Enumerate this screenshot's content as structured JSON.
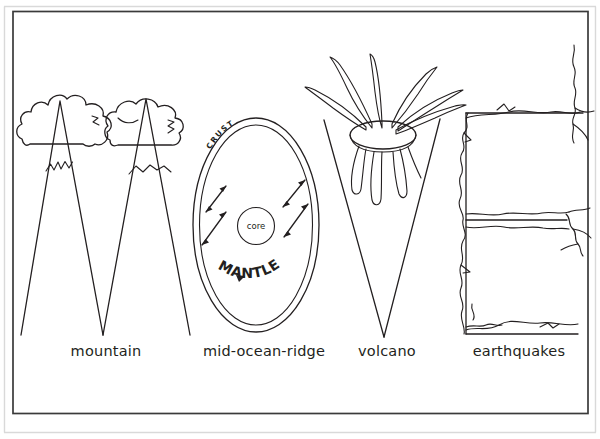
{
  "page": {
    "kind": "coloring-page-line-art",
    "background_color": "#ffffff",
    "ink_color": "#231f20",
    "frame_color": "#3a3a3a",
    "outer_rule_color": "#d9d9d9",
    "word_spelled": "MOVE"
  },
  "letters": [
    {
      "glyph": "M",
      "icon_name": "mountain-illustration",
      "concept": "mountain",
      "details": [
        "two peaks",
        "cloud over each peak",
        "jagged snow line"
      ]
    },
    {
      "glyph": "O",
      "icon_name": "earth-cross-section-illustration",
      "concept": "mid-ocean-ridge",
      "details": [
        "outer ellipse",
        "inner ellipse",
        "core circle",
        "four double-headed arrows"
      ]
    },
    {
      "glyph": "V",
      "icon_name": "volcano-illustration",
      "concept": "volcano",
      "details": [
        "crater ellipse",
        "erupting plumes",
        "lava drips"
      ]
    },
    {
      "glyph": "E",
      "icon_name": "earthquake-cracks-illustration",
      "concept": "earthquakes",
      "details": [
        "three horizontal strokes",
        "jagged fault cracks"
      ]
    }
  ],
  "inline_text": {
    "crust": "CRUST",
    "mantle": "MANTLE",
    "core": "core"
  },
  "captions": [
    {
      "id": "caption-mountain",
      "text": "mountain"
    },
    {
      "id": "caption-mid-ocean-ridge",
      "text": "mid-ocean-ridge"
    },
    {
      "id": "caption-volcano",
      "text": "volcano"
    },
    {
      "id": "caption-earthquakes",
      "text": "earthquakes"
    }
  ]
}
